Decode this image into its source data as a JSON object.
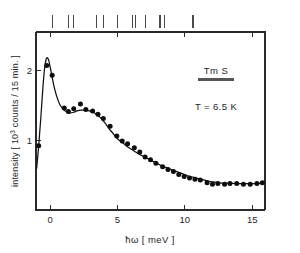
{
  "figure": {
    "background": "#ffffff",
    "ink_color": "#111111",
    "marker_color": "#4a4a4a"
  },
  "labels": {
    "ylabel_prefix": "intensity [ 10",
    "ylabel_exponent": "3",
    "ylabel_suffix": " counts / 15 min. ]",
    "xlabel": "ħω  [ meV ]",
    "sample": "Tm S",
    "temperature": "T = 6.5 K"
  },
  "axes": {
    "x_ticks": [
      "0",
      "5",
      "10",
      "15"
    ],
    "x_tick_values": [
      0,
      5,
      10,
      15
    ],
    "y_ticks": [
      "1",
      "2"
    ],
    "y_tick_values": [
      1,
      2
    ],
    "xlim": [
      -1.05,
      15.95
    ],
    "ylim": [
      0.0,
      2.55
    ],
    "grid": "off"
  },
  "chart_data": {
    "type": "scatter",
    "title": "",
    "subtitle": "",
    "xlabel": "ħω  [ meV ]",
    "ylabel": "intensity [ 10³ counts / 15 min. ]",
    "xlim": [
      -1.05,
      15.95
    ],
    "ylim": [
      0.0,
      2.55
    ],
    "grid": "off",
    "legend_position": "none",
    "annotations": [
      "Tm S",
      "T = 6.5 K"
    ],
    "series": [
      {
        "name": "Tm S inelastic neutron spectrum, T = 6.5 K",
        "marker": "filled-circle",
        "x": [
          -0.85,
          -0.25,
          0.15,
          1.05,
          1.35,
          1.75,
          2.25,
          2.65,
          3.15,
          3.55,
          3.95,
          4.45,
          4.95,
          5.35,
          5.75,
          6.25,
          6.65,
          7.05,
          7.45,
          7.85,
          8.35,
          8.75,
          9.15,
          9.55,
          9.95,
          10.35,
          10.75,
          11.15,
          11.65,
          12.05,
          12.45,
          12.95,
          13.35,
          13.85,
          14.35,
          14.85,
          15.35,
          15.75
        ],
        "y": [
          0.92,
          2.07,
          1.93,
          1.46,
          1.41,
          1.45,
          1.52,
          1.44,
          1.42,
          1.37,
          1.31,
          1.2,
          1.06,
          0.99,
          0.95,
          0.89,
          0.83,
          0.76,
          0.72,
          0.67,
          0.62,
          0.58,
          0.55,
          0.51,
          0.48,
          0.46,
          0.44,
          0.43,
          0.39,
          0.37,
          0.38,
          0.37,
          0.38,
          0.38,
          0.37,
          0.37,
          0.38,
          0.39
        ]
      }
    ],
    "fit_curve": {
      "name": "model fit",
      "x": [
        -1.0,
        -0.85,
        -0.7,
        -0.55,
        -0.42,
        -0.3,
        -0.2,
        -0.1,
        0.0,
        0.15,
        0.3,
        0.5,
        0.7,
        0.9,
        1.1,
        1.3,
        1.5,
        1.75,
        2.0,
        2.3,
        2.6,
        2.9,
        3.2,
        3.5,
        3.8,
        4.1,
        4.4,
        4.7,
        5.0,
        5.4,
        5.8,
        6.2,
        6.6,
        7.0,
        7.4,
        7.8,
        8.2,
        8.6,
        9.0,
        9.4,
        9.8,
        10.2,
        10.6,
        11.0,
        11.4,
        11.8,
        12.2,
        12.6,
        13.0,
        13.5,
        14.0,
        14.5,
        15.0,
        15.5,
        15.9
      ],
      "y": [
        0.6,
        0.92,
        1.3,
        1.72,
        2.02,
        2.16,
        2.18,
        2.14,
        2.05,
        1.9,
        1.76,
        1.62,
        1.52,
        1.46,
        1.42,
        1.4,
        1.39,
        1.4,
        1.42,
        1.43,
        1.43,
        1.42,
        1.4,
        1.36,
        1.31,
        1.24,
        1.16,
        1.09,
        1.02,
        0.96,
        0.9,
        0.85,
        0.8,
        0.76,
        0.72,
        0.68,
        0.64,
        0.61,
        0.58,
        0.55,
        0.52,
        0.49,
        0.47,
        0.45,
        0.43,
        0.41,
        0.4,
        0.39,
        0.385,
        0.38,
        0.378,
        0.378,
        0.379,
        0.381,
        0.383
      ]
    },
    "level_markers": {
      "description": "calculated crystal-field transition energies (vertical bars above frame)",
      "values": [
        0.15,
        1.35,
        1.75,
        3.45,
        3.95,
        5.0,
        6.1,
        6.35,
        7.1,
        8.15,
        8.5,
        10.6
      ]
    }
  }
}
